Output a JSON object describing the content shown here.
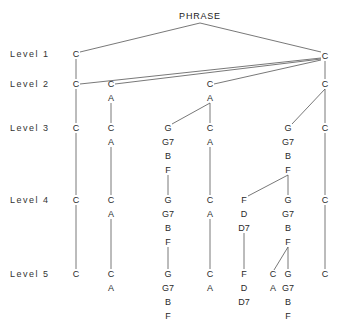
{
  "title": "PHRASE",
  "levels": [
    "Level  1",
    "Level  2",
    "Level  3",
    "Level  4",
    "Level  5"
  ],
  "level_y": [
    54,
    84,
    128,
    200,
    274
  ],
  "nodes": [
    {
      "id": "l1a",
      "x": 76,
      "y": 54,
      "lines": [
        "C"
      ]
    },
    {
      "id": "l1b",
      "x": 325,
      "y": 56,
      "lines": [
        "C"
      ]
    },
    {
      "id": "l2a",
      "x": 76,
      "y": 84,
      "lines": [
        "C"
      ]
    },
    {
      "id": "l2b",
      "x": 111,
      "y": 84,
      "lines": [
        "C",
        "A"
      ]
    },
    {
      "id": "l2c",
      "x": 210,
      "y": 84,
      "lines": [
        "C",
        "A"
      ]
    },
    {
      "id": "l2d",
      "x": 325,
      "y": 84,
      "lines": [
        "C"
      ]
    },
    {
      "id": "l3a",
      "x": 76,
      "y": 128,
      "lines": [
        "C"
      ]
    },
    {
      "id": "l3b",
      "x": 111,
      "y": 128,
      "lines": [
        "C",
        "A"
      ]
    },
    {
      "id": "l3c",
      "x": 168,
      "y": 128,
      "lines": [
        "G",
        "G7",
        "B",
        "F"
      ]
    },
    {
      "id": "l3d",
      "x": 210,
      "y": 128,
      "lines": [
        "C",
        "A"
      ]
    },
    {
      "id": "l3e",
      "x": 288,
      "y": 128,
      "lines": [
        "G",
        "G7",
        "B",
        "F"
      ]
    },
    {
      "id": "l3f",
      "x": 325,
      "y": 128,
      "lines": [
        "C"
      ]
    },
    {
      "id": "l4a",
      "x": 76,
      "y": 200,
      "lines": [
        "C"
      ]
    },
    {
      "id": "l4b",
      "x": 111,
      "y": 200,
      "lines": [
        "C",
        "A"
      ]
    },
    {
      "id": "l4c",
      "x": 168,
      "y": 200,
      "lines": [
        "G",
        "G7",
        "B",
        "F"
      ]
    },
    {
      "id": "l4d",
      "x": 210,
      "y": 200,
      "lines": [
        "C",
        "A"
      ]
    },
    {
      "id": "l4e",
      "x": 244,
      "y": 200,
      "lines": [
        "F",
        "D",
        "D7"
      ]
    },
    {
      "id": "l4f",
      "x": 288,
      "y": 200,
      "lines": [
        "G",
        "G7",
        "B",
        "F"
      ]
    },
    {
      "id": "l4g",
      "x": 325,
      "y": 200,
      "lines": [
        "C"
      ]
    },
    {
      "id": "l5a",
      "x": 76,
      "y": 274,
      "lines": [
        "C"
      ]
    },
    {
      "id": "l5b",
      "x": 111,
      "y": 274,
      "lines": [
        "C",
        "A"
      ]
    },
    {
      "id": "l5c",
      "x": 168,
      "y": 274,
      "lines": [
        "G",
        "G7",
        "B",
        "F"
      ]
    },
    {
      "id": "l5d",
      "x": 210,
      "y": 274,
      "lines": [
        "C",
        "A"
      ]
    },
    {
      "id": "l5e",
      "x": 244,
      "y": 274,
      "lines": [
        "F",
        "D",
        "D7"
      ]
    },
    {
      "id": "l5f",
      "x": 273,
      "y": 274,
      "lines": [
        "C",
        "A"
      ]
    },
    {
      "id": "l5g",
      "x": 288,
      "y": 274,
      "lines": [
        "G",
        "G7",
        "B",
        "F"
      ]
    },
    {
      "id": "l5h",
      "x": 325,
      "y": 274,
      "lines": [
        "C"
      ]
    }
  ],
  "edges": [
    [
      200,
      23,
      80,
      52
    ],
    [
      200,
      23,
      321,
      52
    ],
    [
      76,
      59,
      76,
      79
    ],
    [
      80,
      84,
      321,
      58
    ],
    [
      115,
      84,
      321,
      59
    ],
    [
      214,
      84,
      321,
      60
    ],
    [
      325,
      61,
      325,
      79
    ],
    [
      76,
      89,
      76,
      123
    ],
    [
      111,
      103,
      111,
      123
    ],
    [
      210,
      103,
      172,
      124
    ],
    [
      210,
      103,
      210,
      123
    ],
    [
      325,
      89,
      292,
      124
    ],
    [
      325,
      89,
      325,
      123
    ],
    [
      76,
      133,
      76,
      195
    ],
    [
      111,
      147,
      111,
      195
    ],
    [
      168,
      175,
      168,
      195
    ],
    [
      210,
      147,
      210,
      195
    ],
    [
      288,
      175,
      248,
      196
    ],
    [
      288,
      175,
      288,
      195
    ],
    [
      325,
      133,
      325,
      195
    ],
    [
      76,
      205,
      76,
      269
    ],
    [
      111,
      219,
      111,
      269
    ],
    [
      168,
      247,
      168,
      269
    ],
    [
      210,
      219,
      210,
      269
    ],
    [
      244,
      233,
      244,
      269
    ],
    [
      288,
      247,
      274,
      270
    ],
    [
      288,
      247,
      288,
      269
    ],
    [
      325,
      205,
      325,
      269
    ]
  ],
  "line_spacing": 14,
  "colors": {
    "ink": "#333333",
    "line": "#555555",
    "background": "#ffffff"
  }
}
